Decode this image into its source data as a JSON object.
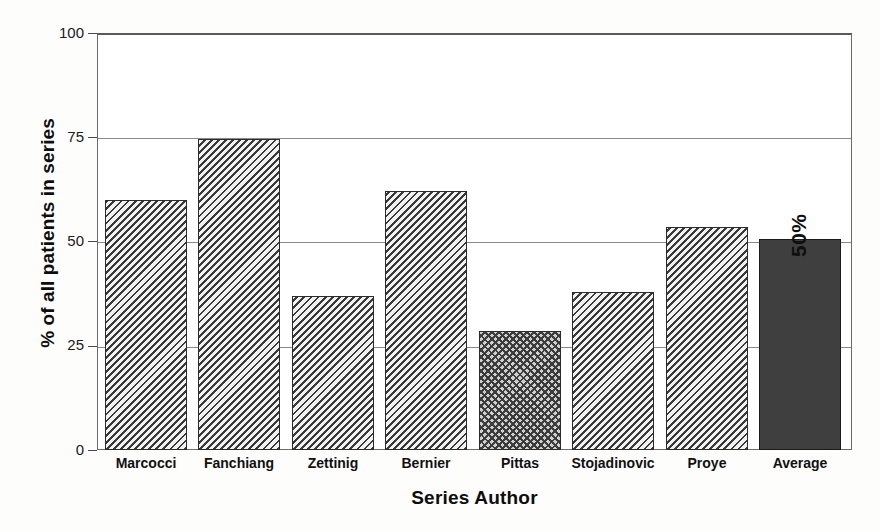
{
  "chart_data": {
    "type": "bar",
    "title": "",
    "xlabel": "Series Author",
    "ylabel": "% of all patients in series",
    "categories": [
      "Marcocci",
      "Fanchiang",
      "Zettinig",
      "Bernier",
      "Pittas",
      "Stojadinovic",
      "Proye",
      "Average"
    ],
    "values": [
      60,
      74.5,
      37,
      62,
      28.5,
      38,
      53.5,
      50.5
    ],
    "ylim": [
      0,
      100
    ],
    "yticks": [
      0,
      25,
      50,
      75,
      100
    ],
    "ytick_labels": [
      "0",
      "25",
      "50",
      "75",
      "100"
    ],
    "grid": true,
    "legend": null,
    "annotations": [
      {
        "text": "50%",
        "target": "Average",
        "orientation": "vertical"
      }
    ],
    "series": [
      {
        "name": "% of all patients in series",
        "values": [
          60,
          74.5,
          37,
          62,
          28.5,
          38,
          53.5,
          50.5
        ],
        "fills": [
          "hatch",
          "hatch",
          "hatch",
          "hatch",
          "cross",
          "hatch",
          "hatch",
          "solid"
        ]
      }
    ]
  },
  "axes": {
    "y_title": "% of all patients in series",
    "x_title": "Series Author",
    "y_tick_0": "0",
    "y_tick_25": "25",
    "y_tick_50": "50",
    "y_tick_75": "75",
    "y_tick_100": "100"
  },
  "labels": {
    "cat_0": "Marcocci",
    "cat_1": "Fanchiang",
    "cat_2": "Zettinig",
    "cat_3": "Bernier",
    "cat_4": "Pittas",
    "cat_5": "Stojadinovic",
    "cat_6": "Proye",
    "cat_7": "Average"
  },
  "annotation": {
    "average_percent": "50%"
  },
  "colors": {
    "bar_hatch_line": "#3a3a3a",
    "bar_hatch_bg": "#f2f2f2",
    "bar_solid": "#3f3f3f",
    "bar_border": "#2b2b2b",
    "gridline": "#8a8a8a",
    "frame": "#6b6b6b",
    "text": "#0d0d0d",
    "background": "#ffffff"
  }
}
